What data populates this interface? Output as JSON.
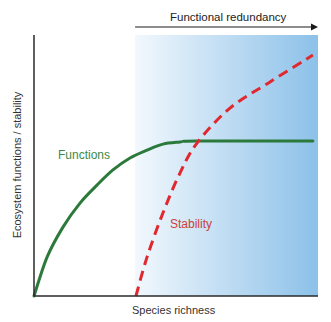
{
  "figure": {
    "top_annotation": "Functional redundancy",
    "x_axis_label": "Species richness",
    "y_axis_label": "Ecosystem functions / stability",
    "labels": {
      "functions": "Functions",
      "stability": "Stability"
    }
  },
  "colors": {
    "functions": "#2b7a3b",
    "functions_label": "#3c8a4a",
    "stability": "#e0282e",
    "stability_label": "#c8413f",
    "axis": "#2a2a2a",
    "shade_start": "#f2f8fd",
    "shade_end": "#8cc1e9"
  },
  "chart_data": {
    "type": "line",
    "title": "",
    "xlabel": "Species richness",
    "ylabel": "Ecosystem functions / stability",
    "xlim": [
      0,
      1
    ],
    "ylim": [
      0,
      1
    ],
    "grid": false,
    "ticks": false,
    "shaded_region": {
      "x_start": 0.356,
      "x_end": 1.0,
      "label": "Functional redundancy",
      "arrow": "right"
    },
    "series": [
      {
        "name": "Functions",
        "style": "solid",
        "x": [
          0,
          0.046,
          0.102,
          0.162,
          0.222,
          0.278,
          0.338,
          0.398,
          0.454,
          0.514,
          0.574,
          0.982
        ],
        "y": [
          0,
          0.149,
          0.264,
          0.356,
          0.425,
          0.483,
          0.529,
          0.559,
          0.582,
          0.59,
          0.594,
          0.594
        ]
      },
      {
        "name": "Stability",
        "style": "dashed",
        "x": [
          0.359,
          0.398,
          0.454,
          0.514,
          0.574,
          0.69,
          0.831,
          0.982
        ],
        "y": [
          0,
          0.149,
          0.318,
          0.471,
          0.586,
          0.72,
          0.82,
          0.923
        ]
      }
    ]
  }
}
